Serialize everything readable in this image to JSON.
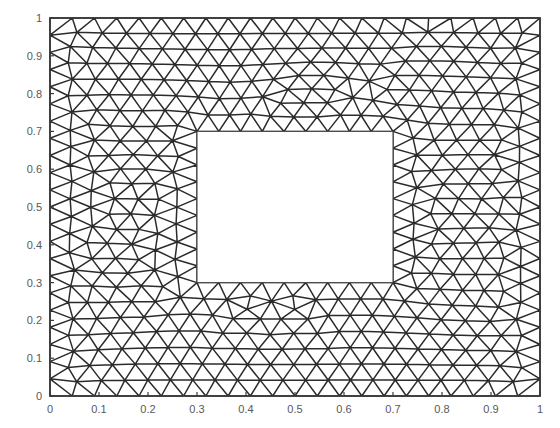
{
  "figure": {
    "title": "",
    "background_color": "#ffffff",
    "width": 560,
    "height": 428
  },
  "plot_box": {
    "left_px": 50,
    "top_px": 18,
    "right_px": 540,
    "bottom_px": 396,
    "border_color": "#3a3a3a",
    "border_width_px": 1.6
  },
  "axes": {
    "x": {
      "label": "",
      "min": 0,
      "max": 1,
      "tick_step": 0.1,
      "tick_values": [
        0,
        0.1,
        0.2,
        0.3,
        0.4,
        0.5,
        0.6,
        0.7,
        0.8,
        0.9,
        1
      ],
      "tick_labels": [
        "0",
        "0.1",
        "0.2",
        "0.3",
        "0.4",
        "0.5",
        "0.6",
        "0.7",
        "0.8",
        "0.9",
        "1"
      ]
    },
    "y": {
      "label": "",
      "min": 0,
      "max": 1,
      "tick_step": 0.1,
      "tick_values": [
        0,
        0.1,
        0.2,
        0.3,
        0.4,
        0.5,
        0.6,
        0.7,
        0.8,
        0.9,
        1
      ],
      "tick_labels": [
        "0",
        "0.1",
        "0.2",
        "0.3",
        "0.4",
        "0.5",
        "0.6",
        "0.7",
        "0.8",
        "0.9",
        "1"
      ]
    },
    "tick_label_color": "#58585a",
    "tick_mark_color": "#3a3a3a",
    "tick_length_px": 4
  },
  "chart_data": {
    "type": "mesh",
    "title": "",
    "xlabel": "",
    "ylabel": "",
    "xlim": [
      0,
      1
    ],
    "ylim": [
      0,
      1
    ],
    "grid": false,
    "legend": null,
    "domain": {
      "outer_boundary": {
        "shape": "square",
        "x_min": 0,
        "x_max": 1,
        "y_min": 0,
        "y_max": 1
      },
      "holes": [
        {
          "shape": "square",
          "x_min": 0.3,
          "x_max": 0.7,
          "y_min": 0.3,
          "y_max": 0.7
        }
      ]
    },
    "mesh": {
      "element_type": "triangle",
      "target_edge_length": 0.0465,
      "edge_color": "#2b2b2b",
      "edge_width_px": 1.5,
      "fill_color": "#ffffff",
      "approx_node_count": 420,
      "approx_element_count": 760,
      "relaxation_iterations": 90,
      "seed": 20240517
    }
  }
}
